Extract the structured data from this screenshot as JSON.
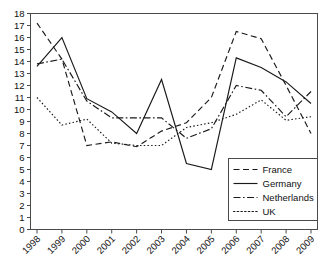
{
  "chart_data": {
    "type": "line",
    "title": "",
    "xlabel": "",
    "ylabel": "",
    "grid": false,
    "legend_position": "bottom-right",
    "x": [
      "1998",
      "1999",
      "2000",
      "2001",
      "2002",
      "2003",
      "2004",
      "2005",
      "2006",
      "2007",
      "2008",
      "2009"
    ],
    "categories": [
      "1998",
      "1999",
      "2000",
      "2001",
      "2002",
      "2003",
      "2004",
      "2005",
      "2006",
      "2007",
      "2008",
      "2009"
    ],
    "xlim": [
      1998,
      2009
    ],
    "ylim": [
      0,
      18
    ],
    "ytick_labels": [
      "0",
      "1",
      "2",
      "3",
      "4",
      "5",
      "6",
      "7",
      "8",
      "9",
      "10",
      "11",
      "12",
      "13",
      "14",
      "15",
      "16",
      "17",
      "18"
    ],
    "ytick_values": [
      0,
      1,
      2,
      3,
      4,
      5,
      6,
      7,
      8,
      9,
      10,
      11,
      12,
      13,
      14,
      15,
      16,
      17,
      18
    ],
    "ytick_step": 1,
    "series": [
      {
        "name": "France",
        "style": "dashed",
        "dash": "6,3.5",
        "values": [
          17.2,
          14.2,
          7.0,
          7.3,
          6.9,
          8.2,
          8.9,
          11.0,
          16.5,
          15.9,
          12.0,
          8.0
        ]
      },
      {
        "name": "Germany",
        "style": "solid",
        "dash": "none",
        "values": [
          13.6,
          16.0,
          10.9,
          9.8,
          8.0,
          12.5,
          5.5,
          5.0,
          14.3,
          13.5,
          12.3,
          10.5
        ]
      },
      {
        "name": "Netherlands",
        "style": "dash-dot",
        "dash": "7,2.5,1.6,2.5",
        "values": [
          13.8,
          14.2,
          10.7,
          9.3,
          9.3,
          9.3,
          7.6,
          8.4,
          12.0,
          11.6,
          9.4,
          11.5
        ]
      },
      {
        "name": "UK",
        "style": "dotted",
        "dash": "1.5,2.2",
        "values": [
          11.0,
          8.7,
          9.2,
          7.2,
          7.0,
          7.0,
          8.5,
          8.9,
          9.6,
          10.8,
          9.1,
          9.4
        ]
      }
    ]
  },
  "legend": {
    "items": [
      {
        "label": "France"
      },
      {
        "label": "Germany"
      },
      {
        "label": "Netherlands"
      },
      {
        "label": "UK"
      }
    ]
  },
  "colors": {
    "line": "#1a1a1a",
    "axis": "#4a4a4a",
    "background": "#ffffff",
    "text": "#111111"
  }
}
